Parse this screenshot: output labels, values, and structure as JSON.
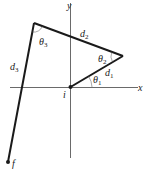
{
  "diagram": {
    "type": "vector displacement diagram",
    "axes": {
      "x_label": "x",
      "y_label": "y",
      "origin_label": "i"
    },
    "end_label": "f",
    "vectors": [
      {
        "name": "d",
        "sub": "1"
      },
      {
        "name": "d",
        "sub": "2"
      },
      {
        "name": "d",
        "sub": "3"
      }
    ],
    "angles": [
      {
        "name": "θ",
        "sub": "1"
      },
      {
        "name": "θ",
        "sub": "2"
      },
      {
        "name": "θ",
        "sub": "3"
      }
    ],
    "colors": {
      "line": "#1a1a1a",
      "axis": "#333333"
    }
  }
}
